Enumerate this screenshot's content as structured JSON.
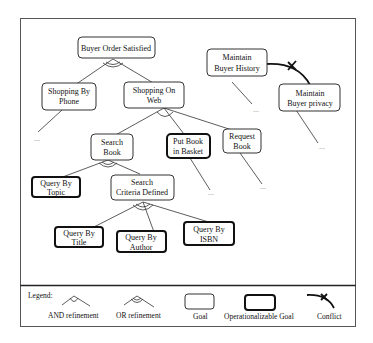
{
  "diagram": {
    "nodes": {
      "buyer_order_satisfied": {
        "lines": [
          "Buyer Order Satisfied"
        ],
        "kind": "goal"
      },
      "shopping_by_phone": {
        "lines": [
          "Shopping By",
          "Phone"
        ],
        "kind": "goal"
      },
      "shopping_on_web": {
        "lines": [
          "Shopping On",
          "Web"
        ],
        "kind": "goal"
      },
      "maintain_buyer_history": {
        "lines": [
          "Maintain",
          "Buyer History"
        ],
        "kind": "goal"
      },
      "maintain_buyer_privacy": {
        "lines": [
          "Maintain",
          "Buyer privacy"
        ],
        "kind": "goal"
      },
      "search_book": {
        "lines": [
          "Search",
          "Book"
        ],
        "kind": "goal"
      },
      "put_book_in_basket": {
        "lines": [
          "Put Book",
          "in Basket"
        ],
        "kind": "operationalizable"
      },
      "request_book": {
        "lines": [
          "Request",
          "Book"
        ],
        "kind": "goal"
      },
      "query_by_topic": {
        "lines": [
          "Query By",
          "Topic"
        ],
        "kind": "operationalizable"
      },
      "search_criteria_defined": {
        "lines": [
          "Search",
          "Criteria Defined"
        ],
        "kind": "goal"
      },
      "query_by_title": {
        "lines": [
          "Query By",
          "Title"
        ],
        "kind": "operationalizable"
      },
      "query_by_author": {
        "lines": [
          "Query By",
          "Author"
        ],
        "kind": "operationalizable"
      },
      "query_by_isbn": {
        "lines": [
          "Query By",
          "ISBN"
        ],
        "kind": "operationalizable"
      }
    },
    "refinements": [
      {
        "parent": "Buyer Order Satisfied",
        "type": "OR",
        "children": [
          "Shopping By Phone",
          "Shopping On Web"
        ]
      },
      {
        "parent": "Shopping On Web",
        "type": "AND",
        "children": [
          "Search Book",
          "Put Book in Basket",
          "Request Book"
        ]
      },
      {
        "parent": "Search Book",
        "type": "OR",
        "children": [
          "Query By Topic",
          "Search Criteria Defined"
        ]
      },
      {
        "parent": "Search Criteria Defined",
        "type": "OR",
        "children": [
          "Query By Title",
          "Query By Author",
          "Query By ISBN"
        ]
      }
    ],
    "conflicts": [
      {
        "from": "Maintain Buyer History",
        "to": "Maintain Buyer privacy"
      }
    ],
    "ellipsis": "..."
  },
  "legend": {
    "title": "Legend:",
    "items": {
      "and_refinement": "AND refinement",
      "or_refinement": "OR refinement",
      "goal": "Goal",
      "operationalizable_goal": "Operationalizable Goal",
      "conflict": "Conflict"
    }
  }
}
